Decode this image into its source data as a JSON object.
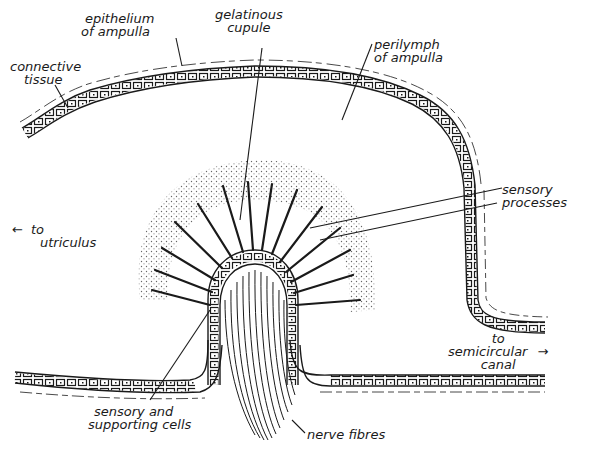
{
  "diagram": {
    "colors": {
      "ink": "#1a1a1a",
      "background": "#ffffff",
      "stipple": "#555555"
    },
    "labels": {
      "epithelium": [
        "epithelium",
        "of ampulla"
      ],
      "connective": [
        "connective",
        "tissue"
      ],
      "cupule": [
        "gelatinous",
        "cupule"
      ],
      "perilymph": [
        "perilymph",
        "of ampulla"
      ],
      "processes": [
        "sensory",
        "processes"
      ],
      "utriculus": [
        "to",
        "utriculus"
      ],
      "canal": [
        "to",
        "semicircular",
        "canal"
      ],
      "cells": [
        "sensory and",
        "supporting cells"
      ],
      "nerve": "nerve fibres"
    },
    "arrows": {
      "left": "←",
      "right": "→"
    }
  }
}
